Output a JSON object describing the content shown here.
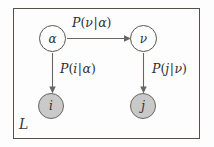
{
  "diagram": {
    "type": "bayesian-network-plate-notation",
    "plate": {
      "label": "L"
    },
    "nodes": [
      {
        "id": "alpha",
        "label": "α",
        "style": "unshaded",
        "role": "latent"
      },
      {
        "id": "nu",
        "label": "ν",
        "style": "unshaded",
        "role": "latent"
      },
      {
        "id": "i",
        "label": "i",
        "style": "shaded",
        "role": "observed"
      },
      {
        "id": "j",
        "label": "j",
        "style": "shaded",
        "role": "observed"
      }
    ],
    "edges": [
      {
        "id": "alpha-to-nu",
        "from": "alpha",
        "to": "nu",
        "label": {
          "fn": "P",
          "open": "(",
          "child": "ν",
          "bar": "|",
          "parent": "α",
          "close": ")"
        }
      },
      {
        "id": "alpha-to-i",
        "from": "alpha",
        "to": "i",
        "label": {
          "fn": "P",
          "open": "(",
          "child": "i",
          "bar": "|",
          "parent": "α",
          "close": ")"
        }
      },
      {
        "id": "nu-to-j",
        "from": "nu",
        "to": "j",
        "label": {
          "fn": "P",
          "open": "(",
          "child": "j",
          "bar": "|",
          "parent": "ν",
          "close": ")"
        }
      }
    ],
    "colors": {
      "background": "#fdfdfd",
      "stroke": "#6a6560",
      "plate_stroke": "#555049",
      "shaded_node_fill": "#c9c9c9",
      "unshaded_node_fill": "#fdfdfd",
      "text": "#2e2e2e"
    }
  }
}
